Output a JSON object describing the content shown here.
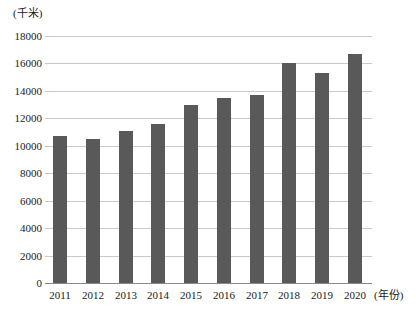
{
  "chart_data": {
    "type": "bar",
    "title": "",
    "xlabel": "(年份)",
    "ylabel": "(千米)",
    "categories": [
      "2011",
      "2012",
      "2013",
      "2014",
      "2015",
      "2016",
      "2017",
      "2018",
      "2019",
      "2020"
    ],
    "values": [
      10700,
      10500,
      11100,
      11600,
      13000,
      13500,
      13700,
      16000,
      15300,
      16700
    ],
    "series": [
      {
        "name": "",
        "values": [
          10700,
          10500,
          11100,
          11600,
          13000,
          13500,
          13700,
          16000,
          15300,
          16700
        ]
      }
    ],
    "ylim": [
      0,
      18000
    ],
    "ytick_labels": [
      "0",
      "2000",
      "4000",
      "6000",
      "8000",
      "10000",
      "12000",
      "14000",
      "16000",
      "18000"
    ],
    "ytick_values": [
      0,
      2000,
      4000,
      6000,
      8000,
      10000,
      12000,
      14000,
      16000,
      18000
    ],
    "grid": true,
    "legend": "none",
    "bar_color": "#595959",
    "gridline_color": "#c9c9c9",
    "axis_color": "#8a8a8a"
  },
  "axis": {
    "y_unit_label": "(千米)",
    "x_unit_label": "(年份)"
  },
  "caption": {
    "text": ""
  }
}
